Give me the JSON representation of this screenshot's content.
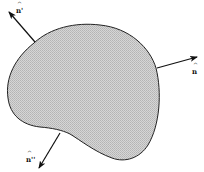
{
  "diagram": {
    "type": "surface-normals",
    "region": {
      "fill_color": "#c8c8c8",
      "stroke_color": "#222222"
    },
    "normals": [
      {
        "id": "n_prime",
        "label": "n",
        "prime": "'",
        "hat": "^"
      },
      {
        "id": "n",
        "label": "n",
        "prime": "",
        "hat": "^"
      },
      {
        "id": "n_double_prime",
        "label": "n",
        "prime": "''",
        "hat": "^"
      }
    ]
  }
}
